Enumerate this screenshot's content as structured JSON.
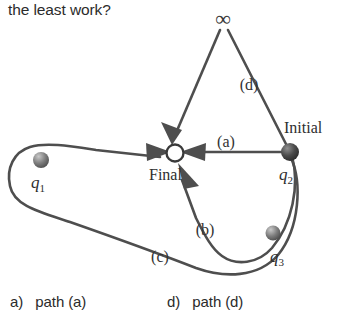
{
  "question": {
    "text": "the least work?"
  },
  "diagram": {
    "nodes": {
      "initial_label": "Initial",
      "final_label": "Final",
      "infinity_symbol": "∞"
    },
    "charges": [
      {
        "symbol": "q",
        "subscript": "1"
      },
      {
        "symbol": "q",
        "subscript": "2"
      },
      {
        "symbol": "q",
        "subscript": "3"
      }
    ],
    "path_labels": [
      {
        "label": "(a)"
      },
      {
        "label": "(b)"
      },
      {
        "label": "(c)"
      },
      {
        "label": "(d)"
      }
    ],
    "colors": {
      "line": "#4e4e4e",
      "text": "#2e2e2e",
      "background": "#ffffff",
      "charge_dark": "#3d3d3d",
      "charge_light": "#9a9a9a"
    }
  },
  "options": [
    {
      "letter": "a)",
      "text": "path (a)"
    },
    {
      "letter": "d)",
      "text": "path (d)"
    }
  ]
}
